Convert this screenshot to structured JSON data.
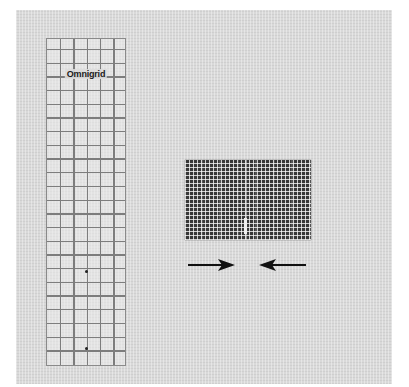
{
  "scene": {
    "background_color": "#ffffff",
    "mat_color": "#d9d9d9"
  },
  "ruler": {
    "brand": "Omnigrid",
    "grid_line_color": "#7d7d7d",
    "columns": 6,
    "rows": 24
  },
  "fabric": {
    "description": "Folded gingham fabric strip with center seam",
    "base_color": "#4a4a4a"
  },
  "arrows": [
    {
      "direction": "right",
      "color": "#111111"
    },
    {
      "direction": "left",
      "color": "#111111"
    }
  ]
}
